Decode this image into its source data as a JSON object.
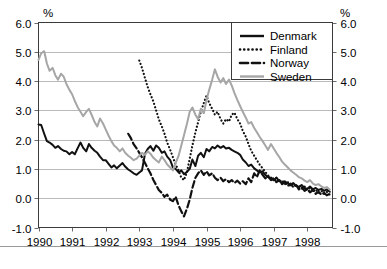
{
  "chart_data": {
    "type": "line",
    "title": "",
    "xlabel": "",
    "ylabel": "%",
    "ylabel_right": "%",
    "ylim": [
      -1.0,
      6.0
    ],
    "xlim": [
      1990.0,
      1998.75
    ],
    "grid": true,
    "grid_axis": "y",
    "legend_position": "top-right",
    "ytick_labels": [
      "6.0",
      "5.0",
      "4.0",
      "3.0",
      "2.0",
      "1.0",
      "0.0",
      "-1.0"
    ],
    "ytick_values": [
      6.0,
      5.0,
      4.0,
      3.0,
      2.0,
      1.0,
      0.0,
      -1.0
    ],
    "xtick_labels": [
      "1990",
      "1991",
      "1992",
      "1993",
      "1994",
      "1995",
      "1996",
      "1997",
      "1998"
    ],
    "xtick_values": [
      1990,
      1991,
      1992,
      1993,
      1994,
      1995,
      1996,
      1997,
      1998
    ],
    "series": [
      {
        "name": "Denmark",
        "color": "#111111",
        "style": "solid",
        "width": 2.0,
        "x": [
          1990.0,
          1990.08,
          1990.17,
          1990.25,
          1990.33,
          1990.42,
          1990.5,
          1990.58,
          1990.67,
          1990.75,
          1990.83,
          1990.92,
          1991.0,
          1991.08,
          1991.17,
          1991.25,
          1991.33,
          1991.42,
          1991.5,
          1991.58,
          1991.67,
          1991.75,
          1991.83,
          1991.92,
          1992.0,
          1992.08,
          1992.17,
          1992.25,
          1992.33,
          1992.42,
          1992.5,
          1992.58,
          1992.67,
          1992.75,
          1992.83,
          1992.92,
          1993.0,
          1993.08,
          1993.17,
          1993.25,
          1993.33,
          1993.42,
          1993.5,
          1993.58,
          1993.67,
          1993.75,
          1993.83,
          1993.92,
          1994.0,
          1994.08,
          1994.17,
          1994.25,
          1994.33,
          1994.42,
          1994.5,
          1994.58,
          1994.67,
          1994.75,
          1994.83,
          1994.92,
          1995.0,
          1995.08,
          1995.17,
          1995.25,
          1995.33,
          1995.42,
          1995.5,
          1995.58,
          1995.67,
          1995.75,
          1995.83,
          1995.92,
          1996.0,
          1996.08,
          1996.17,
          1996.25,
          1996.33,
          1996.42,
          1996.5,
          1996.58,
          1996.67,
          1996.75,
          1996.83,
          1996.92,
          1997.0,
          1997.08,
          1997.17,
          1997.25,
          1997.33,
          1997.42,
          1997.5,
          1997.58,
          1997.67,
          1997.75,
          1997.83,
          1997.92,
          1998.0,
          1998.08,
          1998.17,
          1998.25,
          1998.33,
          1998.42,
          1998.5,
          1998.58,
          1998.67
        ],
        "values": [
          2.52,
          2.5,
          2.2,
          1.95,
          1.9,
          1.82,
          1.72,
          1.78,
          1.68,
          1.62,
          1.6,
          1.5,
          1.58,
          1.5,
          1.72,
          1.9,
          1.72,
          1.6,
          1.85,
          1.72,
          1.62,
          1.55,
          1.42,
          1.3,
          1.3,
          1.18,
          1.05,
          1.12,
          1.02,
          1.12,
          1.2,
          1.08,
          0.98,
          0.92,
          0.85,
          0.8,
          0.88,
          0.95,
          1.52,
          1.68,
          1.78,
          1.62,
          1.8,
          1.72,
          1.55,
          1.6,
          1.42,
          1.3,
          1.05,
          1.0,
          0.88,
          0.95,
          0.82,
          0.9,
          1.0,
          1.32,
          1.1,
          1.45,
          1.55,
          1.4,
          1.68,
          1.6,
          1.75,
          1.7,
          1.8,
          1.72,
          1.78,
          1.7,
          1.72,
          1.65,
          1.6,
          1.55,
          1.48,
          1.32,
          1.22,
          1.1,
          1.15,
          1.02,
          0.95,
          0.88,
          0.92,
          0.8,
          0.72,
          0.68,
          0.62,
          0.7,
          0.58,
          0.52,
          0.58,
          0.5,
          0.45,
          0.52,
          0.42,
          0.38,
          0.45,
          0.35,
          0.32,
          0.4,
          0.3,
          0.35,
          0.28,
          0.32,
          0.25,
          0.3,
          0.22
        ]
      },
      {
        "name": "Finland",
        "color": "#111111",
        "style": "dotted",
        "width": 2.2,
        "x": [
          1993.0,
          1993.08,
          1993.17,
          1993.25,
          1993.33,
          1993.42,
          1993.5,
          1993.58,
          1993.67,
          1993.75,
          1993.83,
          1993.92,
          1994.0,
          1994.08,
          1994.17,
          1994.25,
          1994.33,
          1994.42,
          1994.5,
          1994.58,
          1994.67,
          1994.75,
          1994.83,
          1994.92,
          1995.0,
          1995.08,
          1995.17,
          1995.25,
          1995.33,
          1995.42,
          1995.5,
          1995.58,
          1995.67,
          1995.75,
          1995.83,
          1995.92,
          1996.0,
          1996.08,
          1996.17,
          1996.25,
          1996.33,
          1996.42,
          1996.5,
          1996.58,
          1996.67,
          1996.75,
          1996.83,
          1996.92,
          1997.0,
          1997.08,
          1997.17,
          1997.25,
          1997.33,
          1997.42,
          1997.5,
          1997.58,
          1997.67,
          1997.75,
          1997.83,
          1997.92,
          1998.0,
          1998.08,
          1998.17,
          1998.25,
          1998.33,
          1998.42,
          1998.5,
          1998.58,
          1998.67
        ],
        "values": [
          4.7,
          4.45,
          4.1,
          3.8,
          3.55,
          3.3,
          3.0,
          2.7,
          2.45,
          2.2,
          1.9,
          1.65,
          1.4,
          1.15,
          0.95,
          0.7,
          0.62,
          0.9,
          1.35,
          1.8,
          2.25,
          2.6,
          2.95,
          3.25,
          3.5,
          3.25,
          3.05,
          2.85,
          2.95,
          2.7,
          2.55,
          2.7,
          2.62,
          2.85,
          2.92,
          2.7,
          2.55,
          2.3,
          2.1,
          1.85,
          1.62,
          1.45,
          1.3,
          1.15,
          1.02,
          0.9,
          0.78,
          0.7,
          0.62,
          0.7,
          0.55,
          0.62,
          0.48,
          0.55,
          0.42,
          0.5,
          0.38,
          0.45,
          0.32,
          0.4,
          0.28,
          0.35,
          0.22,
          0.3,
          0.18,
          0.25,
          0.15,
          0.22,
          0.12
        ]
      },
      {
        "name": "Norway",
        "color": "#111111",
        "style": "dashed",
        "width": 2.2,
        "x": [
          1992.67,
          1992.75,
          1992.83,
          1992.92,
          1993.0,
          1993.08,
          1993.17,
          1993.25,
          1993.33,
          1993.42,
          1993.5,
          1993.58,
          1993.67,
          1993.75,
          1993.83,
          1993.92,
          1994.0,
          1994.08,
          1994.17,
          1994.25,
          1994.33,
          1994.42,
          1994.5,
          1994.58,
          1994.67,
          1994.75,
          1994.83,
          1994.92,
          1995.0,
          1995.08,
          1995.17,
          1995.25,
          1995.33,
          1995.42,
          1995.5,
          1995.58,
          1995.67,
          1995.75,
          1995.83,
          1995.92,
          1996.0,
          1996.08,
          1996.17,
          1996.25,
          1996.33,
          1996.42,
          1996.5,
          1996.58,
          1996.67,
          1996.75,
          1996.83,
          1996.92,
          1997.0,
          1997.08,
          1997.17,
          1997.25,
          1997.33,
          1997.42,
          1997.5,
          1997.58,
          1997.67,
          1997.75,
          1997.83,
          1997.92,
          1998.0,
          1998.08,
          1998.17,
          1998.25,
          1998.33,
          1998.42,
          1998.5,
          1998.58,
          1998.67
        ],
        "values": [
          2.2,
          2.05,
          1.85,
          1.7,
          1.55,
          1.4,
          1.2,
          1.02,
          0.85,
          0.62,
          0.45,
          0.28,
          0.18,
          0.05,
          0.12,
          -0.05,
          -0.1,
          0.05,
          -0.25,
          -0.45,
          -0.62,
          -0.35,
          -0.05,
          0.35,
          0.7,
          0.85,
          0.95,
          0.8,
          0.92,
          0.78,
          0.85,
          0.7,
          0.62,
          0.7,
          0.58,
          0.65,
          0.55,
          0.62,
          0.52,
          0.6,
          0.5,
          0.58,
          0.48,
          0.68,
          0.55,
          0.85,
          0.72,
          0.95,
          0.8,
          0.68,
          0.75,
          0.62,
          0.7,
          0.55,
          0.62,
          0.48,
          0.55,
          0.42,
          0.5,
          0.38,
          0.45,
          0.3,
          0.38,
          0.25,
          0.32,
          0.2,
          0.28,
          0.15,
          0.22,
          0.12,
          0.18,
          0.1,
          0.15
        ]
      },
      {
        "name": "Sweden",
        "color": "#a6a6a6",
        "style": "solid",
        "width": 2.0,
        "x": [
          1990.0,
          1990.08,
          1990.17,
          1990.25,
          1990.33,
          1990.42,
          1990.5,
          1990.58,
          1990.67,
          1990.75,
          1990.83,
          1990.92,
          1991.0,
          1991.08,
          1991.17,
          1991.25,
          1991.33,
          1991.42,
          1991.5,
          1991.58,
          1991.67,
          1991.75,
          1991.83,
          1991.92,
          1992.0,
          1992.08,
          1992.17,
          1992.25,
          1992.33,
          1992.42,
          1992.5,
          1992.58,
          1992.67,
          1992.75,
          1992.83,
          1992.92,
          1993.0,
          1993.08,
          1993.17,
          1993.25,
          1993.33,
          1993.42,
          1993.5,
          1993.58,
          1993.67,
          1993.75,
          1993.83,
          1993.92,
          1994.0,
          1994.08,
          1994.17,
          1994.25,
          1994.33,
          1994.42,
          1994.5,
          1994.58,
          1994.67,
          1994.75,
          1994.83,
          1994.92,
          1995.0,
          1995.08,
          1995.17,
          1995.25,
          1995.33,
          1995.42,
          1995.5,
          1995.58,
          1995.67,
          1995.75,
          1995.83,
          1995.92,
          1996.0,
          1996.08,
          1996.17,
          1996.25,
          1996.33,
          1996.42,
          1996.5,
          1996.58,
          1996.67,
          1996.75,
          1996.83,
          1996.92,
          1997.0,
          1997.08,
          1997.17,
          1997.25,
          1997.33,
          1997.42,
          1997.5,
          1997.58,
          1997.67,
          1997.75,
          1997.83,
          1997.92,
          1998.0,
          1998.08,
          1998.17,
          1998.25,
          1998.33,
          1998.42,
          1998.5,
          1998.58,
          1998.67
        ],
        "values": [
          4.72,
          4.95,
          5.02,
          4.6,
          4.35,
          4.45,
          4.2,
          4.05,
          4.25,
          4.15,
          3.9,
          3.7,
          3.55,
          3.32,
          3.1,
          2.95,
          2.8,
          2.95,
          3.05,
          2.85,
          2.6,
          2.45,
          2.72,
          2.55,
          2.35,
          2.15,
          1.95,
          1.8,
          1.72,
          1.6,
          1.7,
          1.55,
          1.45,
          1.38,
          1.3,
          1.35,
          1.45,
          1.55,
          1.48,
          1.6,
          1.52,
          1.38,
          1.3,
          1.22,
          1.42,
          1.3,
          1.15,
          1.05,
          0.95,
          1.2,
          1.45,
          1.8,
          2.15,
          2.55,
          2.95,
          3.1,
          2.85,
          2.7,
          3.05,
          2.9,
          3.35,
          3.7,
          4.05,
          4.4,
          4.15,
          3.95,
          4.1,
          3.9,
          4.05,
          3.85,
          3.6,
          3.35,
          3.15,
          2.95,
          2.75,
          2.55,
          2.6,
          2.4,
          2.25,
          2.1,
          1.95,
          1.8,
          1.65,
          1.85,
          1.7,
          1.55,
          1.4,
          1.25,
          1.15,
          1.05,
          0.95,
          0.88,
          0.8,
          0.72,
          0.68,
          0.6,
          0.55,
          0.62,
          0.5,
          0.45,
          0.48,
          0.4,
          0.35,
          0.38,
          0.3
        ]
      }
    ]
  },
  "legend": {
    "items": [
      {
        "label": "Denmark"
      },
      {
        "label": "Finland"
      },
      {
        "label": "Norway"
      },
      {
        "label": "Sweden"
      }
    ]
  }
}
